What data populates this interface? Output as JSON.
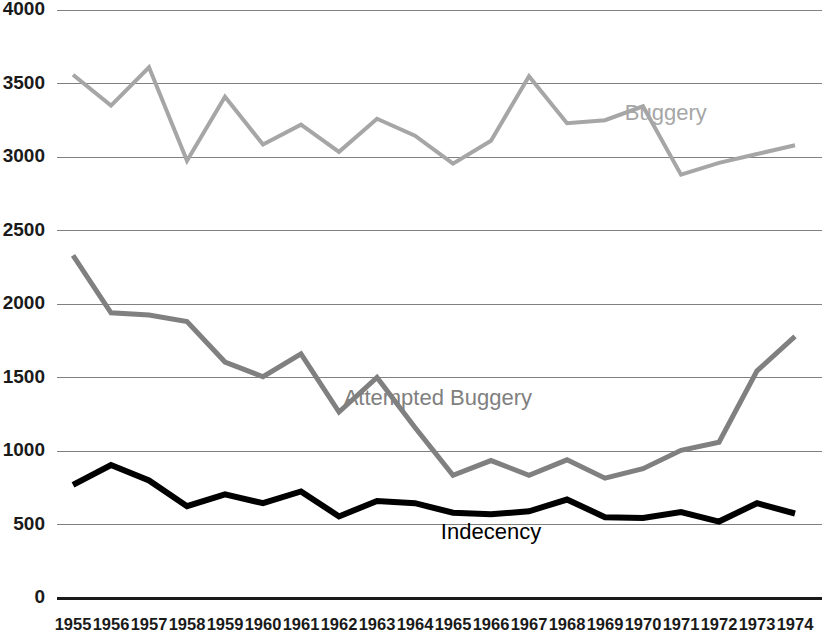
{
  "chart_data": {
    "type": "line",
    "title": "",
    "xlabel": "",
    "ylabel": "",
    "ylim": [
      0,
      4000
    ],
    "ytick_step": 500,
    "grid": true,
    "legend": "inline-labels",
    "x": [
      1955,
      1956,
      1957,
      1958,
      1959,
      1960,
      1961,
      1962,
      1963,
      1964,
      1965,
      1966,
      1967,
      1968,
      1969,
      1970,
      1971,
      1972,
      1973,
      1974
    ],
    "ytick_labels": [
      "0",
      "500",
      "1000",
      "1500",
      "2000",
      "2500",
      "3000",
      "3500",
      "4000"
    ],
    "ytick_values": [
      0,
      500,
      1000,
      1500,
      2000,
      2500,
      3000,
      3500,
      4000
    ],
    "series": [
      {
        "name": "Buggery",
        "color": "#A6A6A6",
        "stroke_width": 4,
        "label_x": 1970.6,
        "label_y": 3250,
        "values": [
          3560,
          3350,
          3610,
          2975,
          3410,
          3085,
          3220,
          3035,
          3260,
          3145,
          2955,
          3110,
          3550,
          3230,
          3250,
          3345,
          2880,
          2960,
          3020,
          3080
        ]
      },
      {
        "name": "Attempted Buggery",
        "color": "#808080",
        "stroke_width": 5,
        "label_x": 1964.6,
        "label_y": 1310,
        "values": [
          2330,
          1940,
          1925,
          1880,
          1605,
          1505,
          1660,
          1265,
          1500,
          1160,
          835,
          935,
          835,
          940,
          815,
          880,
          1005,
          1060,
          1545,
          1780
        ]
      },
      {
        "name": "Indecency",
        "color": "#000000",
        "stroke_width": 6,
        "label_x": 1966.0,
        "label_y": 400,
        "values": [
          770,
          905,
          800,
          625,
          705,
          645,
          725,
          555,
          660,
          645,
          580,
          570,
          590,
          670,
          550,
          545,
          585,
          520,
          645,
          575
        ]
      }
    ]
  },
  "axis": {
    "x_labels": [
      "1955",
      "1956",
      "1957",
      "1958",
      "1959",
      "1960",
      "1961",
      "1962",
      "1963",
      "1964",
      "1965",
      "1966",
      "1967",
      "1968",
      "1969",
      "1970",
      "1971",
      "1972",
      "1973",
      "1974"
    ]
  }
}
